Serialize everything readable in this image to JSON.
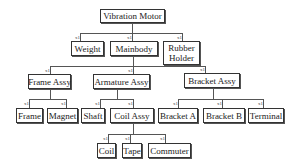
{
  "diagram": {
    "type": "tree",
    "title": "Vibration Motor",
    "nodes": [
      {
        "id": "vibration-motor",
        "label": "Vibration Motor",
        "x": 100,
        "y": 9,
        "w": 65,
        "h": 14
      },
      {
        "id": "weight",
        "label": "Weight",
        "x": 71,
        "y": 41,
        "w": 33,
        "h": 15,
        "qty": "x1"
      },
      {
        "id": "mainbody",
        "label": "Mainbody",
        "x": 110,
        "y": 41,
        "w": 48,
        "h": 15,
        "qty": "x1"
      },
      {
        "id": "rubber-holder",
        "label": "Rubber Holder",
        "label_line1": "Rubber",
        "label_line2": "Holder",
        "x": 163,
        "y": 41,
        "w": 37,
        "h": 24,
        "qty": "x1"
      },
      {
        "id": "frame-assy",
        "label": "Frame Assy",
        "x": 28,
        "y": 74,
        "w": 43,
        "h": 15,
        "qty": "x1"
      },
      {
        "id": "armature-assy",
        "label": "Armature Assy",
        "x": 93,
        "y": 74,
        "w": 57,
        "h": 15,
        "qty": "x1"
      },
      {
        "id": "bracket-assy",
        "label": "Bracket Assy",
        "x": 184,
        "y": 73,
        "w": 56,
        "h": 15,
        "qty": "x1"
      },
      {
        "id": "frame",
        "label": "Frame",
        "x": 16,
        "y": 108,
        "w": 27,
        "h": 15,
        "qty": "x1"
      },
      {
        "id": "magnet",
        "label": "Magnet",
        "x": 47,
        "y": 108,
        "w": 31,
        "h": 15,
        "qty": "x1"
      },
      {
        "id": "shaft",
        "label": "Shaft",
        "x": 81,
        "y": 108,
        "w": 24,
        "h": 15,
        "qty": "x1"
      },
      {
        "id": "coil-assy",
        "label": "Coil Assy",
        "x": 110,
        "y": 108,
        "w": 44,
        "h": 15,
        "qty": "x1"
      },
      {
        "id": "bracket-a",
        "label": "Bracket A",
        "x": 158,
        "y": 108,
        "w": 40,
        "h": 15,
        "qty": "x1"
      },
      {
        "id": "bracket-b",
        "label": "Bracket B",
        "x": 203,
        "y": 108,
        "w": 42,
        "h": 15,
        "qty": "x1"
      },
      {
        "id": "terminal",
        "label": "Terminal",
        "x": 248,
        "y": 108,
        "w": 36,
        "h": 15,
        "qty": "x1"
      },
      {
        "id": "coil",
        "label": "Coil",
        "x": 97,
        "y": 143,
        "w": 19,
        "h": 15,
        "qty": "x1"
      },
      {
        "id": "tape",
        "label": "Tape",
        "x": 122,
        "y": 143,
        "w": 20,
        "h": 15,
        "qty": "x1"
      },
      {
        "id": "commuter",
        "label": "Commuter",
        "x": 148,
        "y": 143,
        "w": 43,
        "h": 15,
        "qty": "x1"
      }
    ],
    "edges": [
      {
        "from": "vibration-motor",
        "to": "weight"
      },
      {
        "from": "vibration-motor",
        "to": "mainbody"
      },
      {
        "from": "vibration-motor",
        "to": "rubber-holder"
      },
      {
        "from": "mainbody",
        "to": "frame-assy"
      },
      {
        "from": "mainbody",
        "to": "armature-assy"
      },
      {
        "from": "mainbody",
        "to": "bracket-assy"
      },
      {
        "from": "frame-assy",
        "to": "frame"
      },
      {
        "from": "frame-assy",
        "to": "magnet"
      },
      {
        "from": "armature-assy",
        "to": "shaft"
      },
      {
        "from": "armature-assy",
        "to": "coil-assy"
      },
      {
        "from": "bracket-assy",
        "to": "bracket-a"
      },
      {
        "from": "bracket-assy",
        "to": "bracket-b"
      },
      {
        "from": "bracket-assy",
        "to": "terminal"
      },
      {
        "from": "coil-assy",
        "to": "coil"
      },
      {
        "from": "coil-assy",
        "to": "tape"
      },
      {
        "from": "coil-assy",
        "to": "commuter"
      }
    ],
    "quantity_label": "x1"
  }
}
